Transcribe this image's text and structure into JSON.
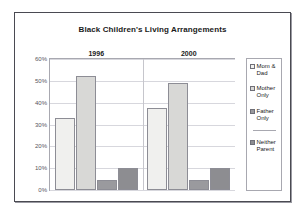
{
  "chart_data": {
    "type": "bar",
    "title": "Black Children's Living Arrangements",
    "xlabel": "",
    "ylabel": "",
    "categories": [
      "1996",
      "2000"
    ],
    "series": [
      {
        "name": "Mom & Dad",
        "values": [
          33,
          37.5
        ],
        "color": "#f0f0ee"
      },
      {
        "name": "Mother Only",
        "values": [
          52,
          49
        ],
        "color": "#d8d8d6"
      },
      {
        "name": "Father Only",
        "values": [
          4.5,
          4.5
        ],
        "color": "#9a9a9e"
      },
      {
        "name": "Neither Parent",
        "values": [
          10,
          10
        ],
        "color": "#8d8d91"
      }
    ],
    "ylim": [
      0,
      60
    ],
    "yticks": [
      "0%",
      "10%",
      "20%",
      "30%",
      "40%",
      "50%",
      "60%"
    ],
    "ytick_values": [
      0,
      10,
      20,
      30,
      40,
      50,
      60
    ],
    "grid": true,
    "legend_position": "right"
  },
  "legend": {
    "items": [
      {
        "label": "Mom &\nDad"
      },
      {
        "label": "Mother\nOnly"
      },
      {
        "label": "Father\nOnly"
      },
      {
        "label": "Neither\nParent"
      }
    ]
  }
}
